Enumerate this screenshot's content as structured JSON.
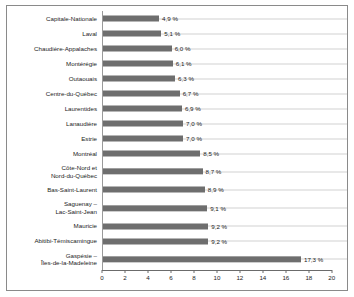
{
  "chart_data": {
    "type": "bar",
    "orientation": "horizontal",
    "title": "",
    "subtitle": "",
    "xlabel": "",
    "ylabel": "",
    "xlim": [
      0,
      20
    ],
    "xticks": [
      0,
      2,
      4,
      6,
      8,
      10,
      12,
      14,
      16,
      18,
      20
    ],
    "xtick_labels": [
      "0",
      "2",
      "4",
      "6",
      "8",
      "10",
      "12",
      "14",
      "16",
      "18",
      "20"
    ],
    "grid": true,
    "grid_axis": "y",
    "legend": null,
    "value_suffix": " %",
    "decimal_separator": ",",
    "bar_color": "#6e6e6e",
    "gridline_color": "#d2d2d2",
    "axis_color": "#6b6b6b",
    "frame_color": "#8a8a8a",
    "text_color": "#1b1b1b",
    "background": "#ffffff",
    "categories": [
      "Capitale-Nationale",
      "Laval",
      "Chaudière-Appalaches",
      "Montérégie",
      "Outaouais",
      "Centre-du-Québec",
      "Laurentides",
      "Lanaudière",
      "Estrie",
      "Montréal",
      "Côte-Nord et\nNord-du-Québec",
      "Bas-Saint-Laurent",
      "Saguenay –\nLac-Saint-Jean",
      "Mauricie",
      "Abitibi-Témiscamingue",
      "Gaspésie –\nÎles-de-la-Madeleine"
    ],
    "values": [
      4.9,
      5.1,
      6.0,
      6.1,
      6.3,
      6.7,
      6.9,
      7.0,
      7.0,
      8.5,
      8.7,
      8.9,
      9.1,
      9.2,
      9.2,
      17.3
    ],
    "data_labels": [
      "4,9 %",
      "5,1 %",
      "6,0 %",
      "6,1 %",
      "6,3 %",
      "6,7 %",
      "6,9 %",
      "7,0 %",
      "7,0 %",
      "8,5 %",
      "8,7 %",
      "8,9 %",
      "9,1 %",
      "9,2 %",
      "9,2 %",
      "17,3 %"
    ],
    "two_line_rows": [
      10,
      12,
      15
    ]
  }
}
